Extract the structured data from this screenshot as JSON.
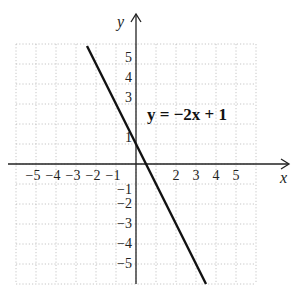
{
  "chart_data": {
    "type": "line",
    "title": "",
    "xlabel": "x",
    "ylabel": "y",
    "xlim": [
      -6,
      6
    ],
    "ylim": [
      -6,
      6
    ],
    "grid": true,
    "x_tick_labels": [
      "-5",
      "-4",
      "-3",
      "-2",
      "-1",
      "2",
      "3",
      "4",
      "5"
    ],
    "x_tick_values": [
      -5,
      -4,
      -3,
      -2,
      -1,
      2,
      3,
      4,
      5
    ],
    "y_tick_labels": [
      "5",
      "4",
      "3",
      "1",
      "-1",
      "-2",
      "-3",
      "-4",
      "-5"
    ],
    "y_tick_values": [
      5,
      4,
      3,
      1,
      -1,
      -2,
      -3,
      -4,
      -5
    ],
    "series": [
      {
        "name": "y = -2x + 1",
        "slope": -2,
        "intercept": 1,
        "x": [
          -2.45,
          3.5
        ],
        "y": [
          5.9,
          -6.0
        ]
      }
    ],
    "annotations": [
      {
        "text": "y = −2x + 1",
        "x": 0.6,
        "y": 2.2
      }
    ]
  },
  "labels": {
    "x_axis": "x",
    "y_axis": "y",
    "equation": "y = −2x + 1"
  },
  "colors": {
    "line": "#111111",
    "axis": "#222222",
    "grid": "#b8b8b8",
    "background": "#ffffff"
  }
}
